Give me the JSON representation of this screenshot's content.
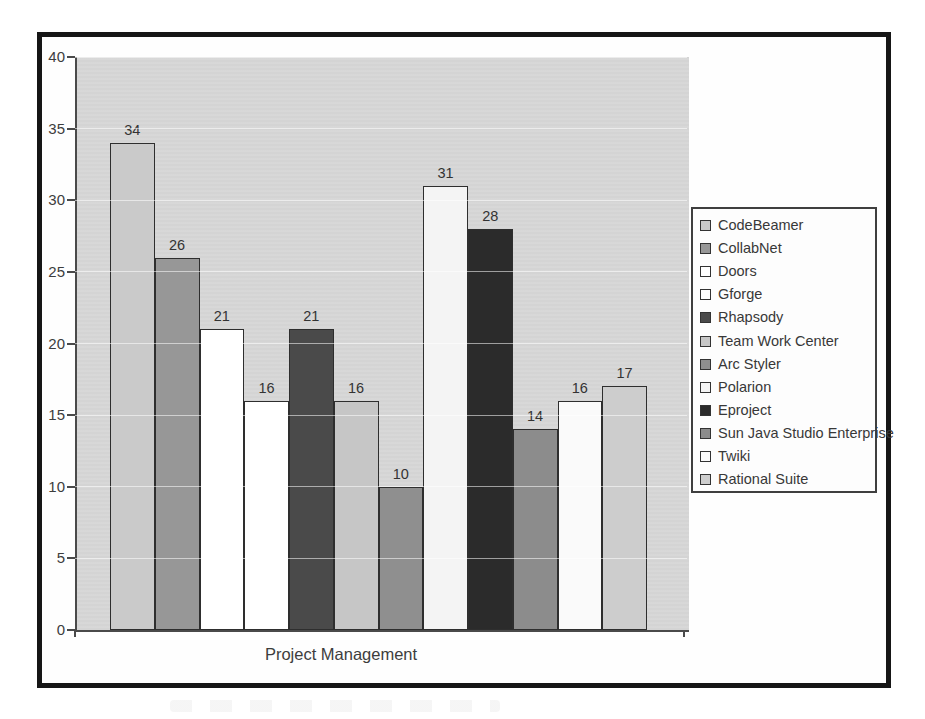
{
  "chart_data": {
    "type": "bar",
    "title": "",
    "xlabel": "Project Management",
    "ylabel": "",
    "ylim": [
      0,
      40
    ],
    "ytick_step": 5,
    "yticks": [
      0,
      5,
      10,
      15,
      20,
      25,
      30,
      35,
      40
    ],
    "grid": "faint horizontal gridlines every 5",
    "legend_position": "right",
    "value_labels": "above each bar",
    "categories": [
      "Project Management"
    ],
    "series": [
      {
        "name": "CodeBeamer",
        "value": 34,
        "color": "#cacaca"
      },
      {
        "name": "CollabNet",
        "value": 26,
        "color": "#979797"
      },
      {
        "name": "Doors",
        "value": 21,
        "color": "#ffffff"
      },
      {
        "name": "Gforge",
        "value": 16,
        "color": "#ffffff"
      },
      {
        "name": "Rhapsody",
        "value": 21,
        "color": "#4a4a4a"
      },
      {
        "name": "Team Work Center",
        "value": 16,
        "color": "#c6c6c6"
      },
      {
        "name": "Arc Styler",
        "value": 10,
        "color": "#8f8f8f"
      },
      {
        "name": "Polarion",
        "value": 31,
        "color": "#f4f4f4"
      },
      {
        "name": "Eproject",
        "value": 28,
        "color": "#2b2b2b"
      },
      {
        "name": "Sun Java Studio Enterprise",
        "value": 14,
        "color": "#8c8c8c"
      },
      {
        "name": "Twiki",
        "value": 16,
        "color": "#fafafa"
      },
      {
        "name": "Rational Suite",
        "value": 17,
        "color": "#cdcdcd"
      }
    ]
  },
  "colors": {
    "frame_border": "#161616",
    "plot_background": "#d7d7d7",
    "axis_line": "#4a4a4a",
    "bar_border": "#2e2e2e",
    "text": "#3d3d3d",
    "legend_background": "#fdfdfd"
  }
}
